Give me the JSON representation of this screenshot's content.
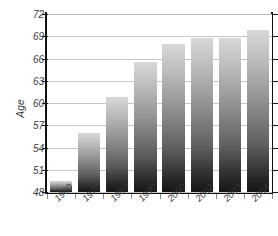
{
  "chart_data": {
    "type": "bar",
    "title": "",
    "subtitle": "",
    "xlabel": "",
    "ylabel": "Age",
    "categories": [
      "1960",
      "1970",
      "1980",
      "1990",
      "2000",
      "2002",
      "2003",
      "2004"
    ],
    "values": [
      49.5,
      56.0,
      60.8,
      65.5,
      67.9,
      68.7,
      68.7,
      69.8
    ],
    "series": [
      {
        "name": "Age",
        "values": [
          49.5,
          56.0,
          60.8,
          65.5,
          67.9,
          68.7,
          68.7,
          69.8
        ]
      }
    ],
    "ylim": [
      48,
      72
    ],
    "xlim": [
      0,
      8
    ],
    "y_ticks": [
      48,
      51,
      54,
      57,
      60,
      63,
      66,
      69,
      72
    ],
    "y_tick_labels": [
      "48",
      "51",
      "54",
      "57",
      "60",
      "63",
      "66",
      "69",
      "72"
    ],
    "y_tick_interval": 3,
    "grid": true,
    "grid_axis": "y",
    "legend": false,
    "legend_position": "none",
    "annotations": [],
    "bar_fill_style": "vertical-gradient-light-top-dark-bottom",
    "colors": {
      "bar_top": "#d8d8d8",
      "bar_bottom": "#141414",
      "gridline": "#c6c6c6",
      "axis": "#111111",
      "tick_label": "#3a3a3a",
      "background": "#ffffff"
    },
    "x_tick_label_rotation": -45,
    "y_axis_title_rotation": -90
  }
}
